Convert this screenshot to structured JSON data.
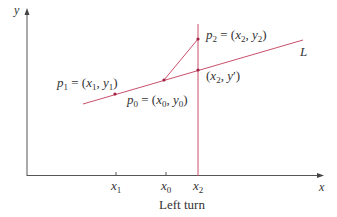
{
  "diagram": {
    "title": "Left turn",
    "axes": {
      "x_label": "x",
      "y_label": "y"
    },
    "line_label": "L",
    "points": {
      "p1": {
        "name": "p",
        "sub": "1",
        "eq": " = (",
        "x": "x",
        "xs": "1",
        "sep": ", ",
        "y": "y",
        "ys": "1",
        "close": ")"
      },
      "p0": {
        "name": "p",
        "sub": "0",
        "eq": " = (",
        "x": "x",
        "xs": "0",
        "sep": ", ",
        "y": "y",
        "ys": "0",
        "close": ")"
      },
      "p2": {
        "name": "p",
        "sub": "2",
        "eq": " = (",
        "x": "x",
        "xs": "2",
        "sep": ", ",
        "y": "y",
        "ys": "2",
        "close": ")"
      },
      "proj": {
        "open": "(",
        "x": "x",
        "xs": "2",
        "sep": ", ",
        "y": "y",
        "prime": "′",
        "close": ")"
      }
    },
    "ticks": [
      {
        "name": "x",
        "sub": "1"
      },
      {
        "name": "x",
        "sub": "0"
      },
      {
        "name": "x",
        "sub": "2"
      }
    ],
    "colors": {
      "axis": "#555555",
      "accent": "#c8506a",
      "text": "#333333"
    }
  }
}
